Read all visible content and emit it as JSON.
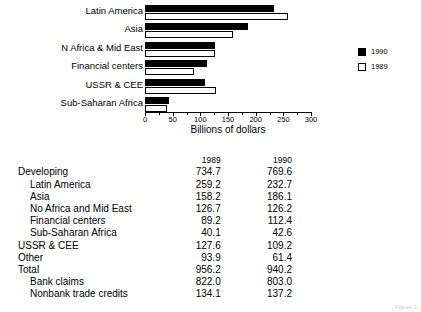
{
  "chart_data": {
    "type": "bar",
    "orientation": "horizontal",
    "title": "",
    "xlabel": "Billions of dollars",
    "ylabel": "",
    "xlim": [
      0,
      300
    ],
    "xticks": [
      0,
      50,
      100,
      150,
      200,
      250,
      300
    ],
    "xtick_labels": [
      "0",
      "50",
      "100",
      "150",
      "200",
      "250",
      "300"
    ],
    "minor_ticks": [
      25,
      75,
      125,
      175,
      225,
      275
    ],
    "grid": false,
    "legend_position": "right",
    "categories": [
      "Latin America",
      "Asia",
      "N Africa & Mid East",
      "Financial centers",
      "USSR & CEE",
      "Sub-Saharan Africa"
    ],
    "series": [
      {
        "name": "1990",
        "color": "#000000",
        "values": [
          232.7,
          186.1,
          126.2,
          112.4,
          109.2,
          42.6
        ]
      },
      {
        "name": "1989",
        "color": "#ffffff",
        "values": [
          259.2,
          158.2,
          126.7,
          89.2,
          127.6,
          40.1
        ]
      }
    ]
  },
  "legend": {
    "items": [
      {
        "label": "1990",
        "style": "filled"
      },
      {
        "label": "1989",
        "style": "hollow"
      }
    ]
  },
  "table": {
    "columns": [
      "",
      "1989",
      "1990"
    ],
    "rows": [
      {
        "name": "Developing",
        "indent": 0,
        "bold": false,
        "y1989": "734.7",
        "y1990": "769.6"
      },
      {
        "name": "Latin America",
        "indent": 1,
        "bold": false,
        "y1989": "259.2",
        "y1990": "232.7"
      },
      {
        "name": "Asia",
        "indent": 1,
        "bold": false,
        "y1989": "158.2",
        "y1990": "186.1"
      },
      {
        "name": "No Africa and Mid East",
        "indent": 1,
        "bold": false,
        "y1989": "126.7",
        "y1990": "126.2"
      },
      {
        "name": "Financial centers",
        "indent": 1,
        "bold": false,
        "y1989": "89.2",
        "y1990": "112.4"
      },
      {
        "name": "Sub-Saharan Africa",
        "indent": 1,
        "bold": false,
        "y1989": "40.1",
        "y1990": "42.6"
      },
      {
        "name": "USSR & CEE",
        "indent": 0,
        "bold": false,
        "y1989": "127.6",
        "y1990": "109.2"
      },
      {
        "name": "Other",
        "indent": 0,
        "bold": false,
        "y1989": "93.9",
        "y1990": "61.4"
      },
      {
        "name": "Total",
        "indent": 0,
        "bold": true,
        "y1989": "956.2",
        "y1990": "940.2"
      },
      {
        "name": "Bank claims",
        "indent": 1,
        "bold": false,
        "y1989": "822.0",
        "y1990": "803.0"
      },
      {
        "name": "Nonbank trade credits",
        "indent": 1,
        "bold": false,
        "y1989": "134.1",
        "y1990": "137.2"
      }
    ]
  },
  "footer": {
    "caption": "Figure 1"
  }
}
